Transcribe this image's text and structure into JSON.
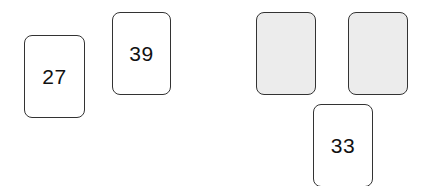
{
  "board": {
    "face_up_cards": [
      {
        "id": "card-27",
        "value": "27"
      },
      {
        "id": "card-39",
        "value": "39"
      },
      {
        "id": "card-33",
        "value": "33"
      }
    ],
    "face_down_cards": [
      {
        "id": "card-back-1"
      },
      {
        "id": "card-back-2"
      }
    ]
  },
  "colors": {
    "card_face": "#ffffff",
    "card_back": "#ececec",
    "card_border": "#333333",
    "text": "#111111"
  }
}
